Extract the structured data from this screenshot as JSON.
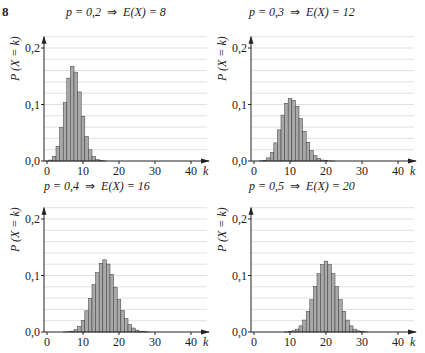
{
  "exercise_number": "8",
  "panels": [
    {
      "title_p": "p = 0,2",
      "arrow": "⇒",
      "title_e": "E(X) = 8",
      "n": 40,
      "p": 0.2
    },
    {
      "title_p": "p = 0,3",
      "arrow": "⇒",
      "title_e": "E(X) = 12",
      "n": 40,
      "p": 0.3
    },
    {
      "title_p": "p = 0,4",
      "arrow": "⇒",
      "title_e": "E(X) = 16",
      "n": 40,
      "p": 0.4
    },
    {
      "title_p": "p = 0,5",
      "arrow": "⇒",
      "title_e": "E(X) = 20",
      "n": 40,
      "p": 0.5
    }
  ],
  "axis": {
    "ylabel": "P (X = k)",
    "xlabel": "k",
    "yticks": [
      "0,0",
      "0,1",
      "0,2"
    ],
    "xticks": [
      "0",
      "10",
      "20",
      "30",
      "40"
    ]
  },
  "colors": {
    "bar": "#a9a9a9",
    "bar_edge": "#3a3a3a",
    "grid": "#d4d4d4",
    "axis": "#222222"
  },
  "chart_data": [
    {
      "type": "bar",
      "title": "p = 0,2 ⇒ E(X) = 8",
      "xlabel": "k",
      "ylabel": "P (X = k)",
      "xlim": [
        0,
        40
      ],
      "ylim": [
        0,
        0.2
      ],
      "grid": true,
      "x": [
        0,
        1,
        2,
        3,
        4,
        5,
        6,
        7,
        8,
        9,
        10,
        11,
        12,
        13,
        14,
        15,
        16,
        17,
        18,
        19,
        20
      ],
      "values": [
        0.0001,
        0.0017,
        0.0083,
        0.026,
        0.0591,
        0.1035,
        0.1467,
        0.1677,
        0.1573,
        0.1223,
        0.0793,
        0.0433,
        0.0199,
        0.0078,
        0.0026,
        0.0007,
        0.0002,
        0.0,
        0.0,
        0.0,
        0.0
      ]
    },
    {
      "type": "bar",
      "title": "p = 0,3 ⇒ E(X) = 12",
      "xlabel": "k",
      "ylabel": "P (X = k)",
      "xlim": [
        0,
        40
      ],
      "ylim": [
        0,
        0.2
      ],
      "grid": true,
      "x": [
        2,
        3,
        4,
        5,
        6,
        7,
        8,
        9,
        10,
        11,
        12,
        13,
        14,
        15,
        16,
        17,
        18,
        19,
        20,
        21,
        22,
        23,
        24
      ],
      "values": [
        0.0003,
        0.0014,
        0.0055,
        0.015,
        0.0321,
        0.0551,
        0.0812,
        0.1021,
        0.1105,
        0.1076,
        0.0969,
        0.0751,
        0.0526,
        0.0331,
        0.0186,
        0.0094,
        0.0043,
        0.0017,
        0.0006,
        0.0002,
        0.0001,
        0.0,
        0.0
      ]
    },
    {
      "type": "bar",
      "title": "p = 0,4 ⇒ E(X) = 16",
      "xlabel": "k",
      "ylabel": "P (X = k)",
      "xlim": [
        0,
        40
      ],
      "ylim": [
        0,
        0.2
      ],
      "grid": true,
      "x": [
        5,
        6,
        7,
        8,
        9,
        10,
        11,
        12,
        13,
        14,
        15,
        16,
        17,
        18,
        19,
        20,
        21,
        22,
        23,
        24,
        25,
        26,
        27,
        28
      ],
      "values": [
        0.0001,
        0.0004,
        0.0015,
        0.0042,
        0.01,
        0.0207,
        0.0375,
        0.0594,
        0.0838,
        0.1051,
        0.1214,
        0.1278,
        0.1202,
        0.1019,
        0.0794,
        0.0573,
        0.0382,
        0.0235,
        0.0133,
        0.007,
        0.0034,
        0.0015,
        0.0006,
        0.0002
      ]
    },
    {
      "type": "bar",
      "title": "p = 0,5 ⇒ E(X) = 20",
      "xlabel": "k",
      "ylabel": "P (X = k)",
      "xlim": [
        0,
        40
      ],
      "ylim": [
        0,
        0.2
      ],
      "grid": true,
      "x": [
        9,
        10,
        11,
        12,
        13,
        14,
        15,
        16,
        17,
        18,
        19,
        20,
        21,
        22,
        23,
        24,
        25,
        26,
        27,
        28,
        29,
        30,
        31
      ],
      "values": [
        0.0002,
        0.0008,
        0.0021,
        0.0051,
        0.0109,
        0.0211,
        0.0366,
        0.0572,
        0.0807,
        0.1031,
        0.1194,
        0.1254,
        0.1194,
        0.1031,
        0.0807,
        0.0572,
        0.0366,
        0.0211,
        0.0109,
        0.0051,
        0.0021,
        0.0008,
        0.0002
      ]
    }
  ]
}
